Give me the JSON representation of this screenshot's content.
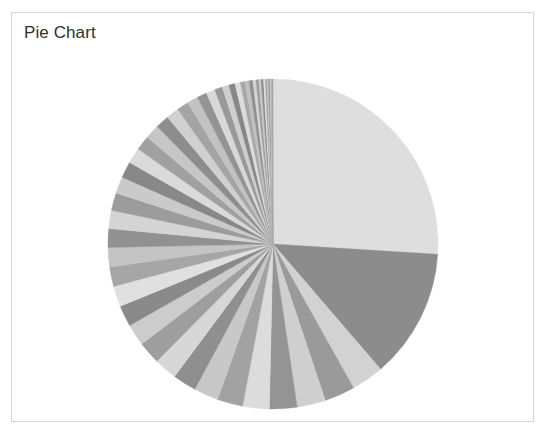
{
  "panel": {
    "title": "Pie Chart",
    "background_color": "#ffffff",
    "border_color": "#d6d6d6"
  },
  "chart_data": {
    "type": "pie",
    "title": "Pie Chart",
    "xlabel": "",
    "ylabel": "",
    "legend": "none",
    "grid": false,
    "start_angle_deg": 0,
    "direction": "clockwise",
    "center_px": [
      272,
      243
    ],
    "radius_px": 165,
    "total": 100,
    "units": "percent",
    "categories": [
      "Slice 1",
      "Slice 2",
      "Slice 3",
      "Slice 4",
      "Slice 5",
      "Slice 6",
      "Slice 7",
      "Slice 8",
      "Slice 9",
      "Slice 10",
      "Slice 11",
      "Slice 12",
      "Slice 13",
      "Slice 14",
      "Slice 15",
      "Slice 16",
      "Slice 17",
      "Slice 18",
      "Slice 19",
      "Slice 20",
      "Slice 21",
      "Slice 22",
      "Slice 23",
      "Slice 24",
      "Slice 25",
      "Slice 26",
      "Slice 27",
      "Slice 28",
      "Slice 29",
      "Slice 30",
      "Slice 31",
      "Slice 32",
      "Slice 33",
      "Slice 34",
      "Slice 35",
      "Slice 36",
      "Slice 37",
      "Slice 38",
      "Slice 39",
      "Slice 40",
      "Slice 41",
      "Slice 42",
      "Slice 43",
      "Slice 44",
      "Slice 45",
      "Slice 46",
      "Slice 47",
      "Slice 48",
      "Slice 49",
      "Slice 50"
    ],
    "values": [
      27.0,
      13.2,
      3.3,
      3.1,
      2.9,
      2.8,
      2.7,
      2.6,
      2.5,
      2.4,
      2.35,
      2.3,
      2.2,
      2.15,
      2.1,
      2.0,
      1.95,
      1.9,
      1.85,
      1.8,
      1.7,
      1.65,
      1.6,
      1.5,
      1.45,
      1.4,
      1.3,
      1.2,
      1.1,
      1.0,
      0.9,
      0.8,
      0.7,
      0.62,
      0.55,
      0.48,
      0.42,
      0.37,
      0.32,
      0.28,
      0.25,
      0.22,
      0.19,
      0.17,
      0.15,
      0.13,
      0.11,
      0.09,
      0.07,
      0.05
    ],
    "colors": [
      "#dedede",
      "#8c8c8c",
      "#d2d2d2",
      "#9a9a9a",
      "#cfcfcf",
      "#949494",
      "#dcdcdc",
      "#a2a2a2",
      "#c8c8c8",
      "#8f8f8f",
      "#d7d7d7",
      "#9e9e9e",
      "#cccccc",
      "#8a8a8a",
      "#e0e0e0",
      "#a6a6a6",
      "#c4c4c4",
      "#919191",
      "#d4d4d4",
      "#9c9c9c",
      "#cacaca",
      "#888888",
      "#dadada",
      "#a0a0a0",
      "#c6c6c6",
      "#8d8d8d",
      "#d0d0d0",
      "#a4a4a4",
      "#c2c2c2",
      "#939393",
      "#d8d8d8",
      "#999999",
      "#cecece",
      "#878787",
      "#dcdcdc",
      "#a8a8a8",
      "#c0c0c0",
      "#909090",
      "#d5d5d5",
      "#9b9b9b",
      "#c9c9c9",
      "#898989",
      "#dfdfdf",
      "#a3a3a3",
      "#c5c5c5",
      "#8e8e8e",
      "#d3d3d3",
      "#a1a1a1",
      "#c7c7c7",
      "#959595"
    ]
  }
}
